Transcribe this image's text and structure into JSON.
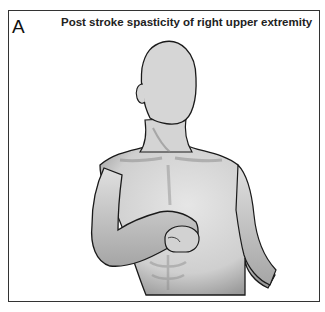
{
  "figure": {
    "panel_label": "A",
    "title": "Post stroke spasticity of right upper extremity",
    "colors": {
      "border": "#333333",
      "skin": "#d9d9d9",
      "shade": "#8a8a8a",
      "outline": "#1a1a1a"
    }
  }
}
